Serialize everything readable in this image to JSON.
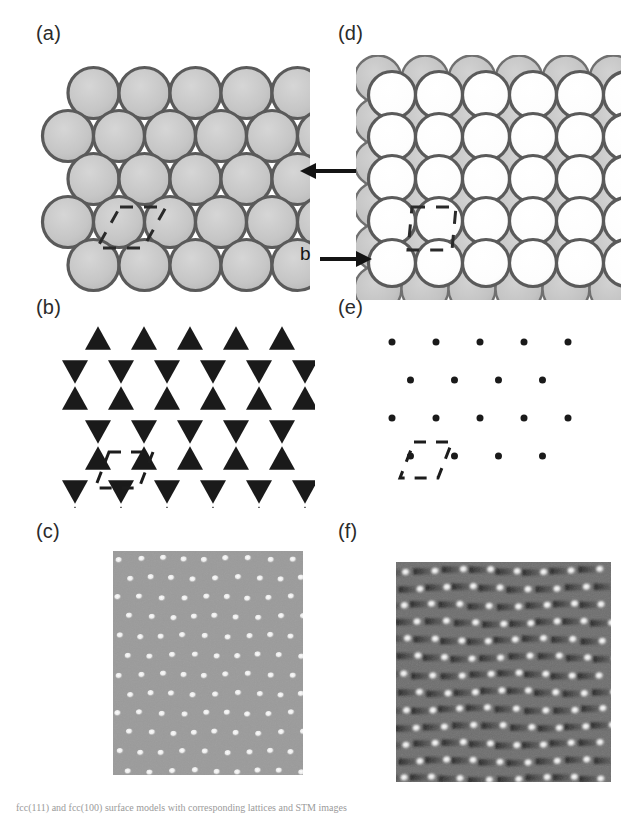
{
  "figure": {
    "background_color": "#ffffff",
    "width": 642,
    "height": 811,
    "caption_fragment": "fcc(111) and fcc(100) surface models with corresponding lattices and STM images"
  },
  "panels": [
    {
      "id": "a",
      "label": "(a)",
      "type": "hard-sphere-model",
      "description": "close-packed hexagonal sphere model, gray spheres",
      "label_x": 36,
      "label_y": 32,
      "box": {
        "x": 40,
        "y": 68,
        "width": 250,
        "height": 220
      },
      "sphere_fill": "#c6c6c6",
      "sphere_stroke": "#5a5a5a",
      "rows": [
        5,
        6,
        5,
        6,
        5
      ],
      "row_offsets": [
        0.5,
        0.0,
        0.5,
        0.0,
        0.5
      ],
      "sphere_radius_px": 25,
      "row_pitch_px": 43,
      "unit_cell": {
        "shape": "rhombus",
        "style": "dashed",
        "vertices": [
          [
            118,
            207
          ],
          [
            166,
            207
          ],
          [
            142,
            250
          ],
          [
            94,
            250
          ]
        ]
      }
    },
    {
      "id": "d",
      "label": "(d)",
      "type": "hard-sphere-model",
      "description": "square/quasi-square sphere model, white front layer over gray back layer",
      "label_x": 338,
      "label_y": 32,
      "box": {
        "x": 366,
        "y": 68,
        "width": 245,
        "height": 220
      },
      "sphere_fill": "#ffffff",
      "back_sphere_fill": "#c6c6c6",
      "sphere_stroke": "#5a5a5a",
      "rows": [
        6,
        6,
        6,
        6,
        6
      ],
      "sphere_radius_px": 23,
      "row_pitch_px": 42,
      "unit_cell": {
        "shape": "rhombus",
        "style": "dashed",
        "vertices": [
          [
            410,
            210
          ],
          [
            456,
            210
          ],
          [
            452,
            253
          ],
          [
            406,
            253
          ]
        ]
      }
    },
    {
      "id": "b",
      "label": "(b)",
      "type": "triangle-lattice",
      "description": "alternating up and down filled triangles on a honeycomb net",
      "label_x": 36,
      "label_y": 306,
      "box": {
        "x": 72,
        "y": 330,
        "width": 225,
        "height": 175
      },
      "marker_color": "#1a1a1a",
      "marker_size_px": 13,
      "unit_cell": {
        "shape": "rhombus",
        "style": "dashed",
        "vertices": [
          [
            108,
            452
          ],
          [
            152,
            452
          ],
          [
            138,
            488
          ],
          [
            94,
            488
          ]
        ]
      }
    },
    {
      "id": "e",
      "label": "(e)",
      "type": "dot-lattice",
      "description": "hexagonal array of small filled dots",
      "label_x": 338,
      "label_y": 306,
      "box": {
        "x": 388,
        "y": 340,
        "width": 215,
        "height": 155
      },
      "marker_color": "#1a1a1a",
      "marker_size_px": 7,
      "rows": [
        5,
        4,
        5,
        4
      ],
      "unit_cell": {
        "shape": "rhombus",
        "style": "dashed",
        "vertices": [
          [
            412,
            450
          ],
          [
            450,
            450
          ],
          [
            436,
            485
          ],
          [
            398,
            485
          ]
        ]
      }
    },
    {
      "id": "c",
      "label": "(c)",
      "type": "stm-image",
      "description": "STM topograph, light gray background with bright protrusions in hexagonal array",
      "label_x": 36,
      "label_y": 530,
      "box": {
        "x": 113,
        "y": 551,
        "width": 190,
        "height": 224
      },
      "background_color": "#9b9b9b",
      "spot_color": "#f2f2f2",
      "rows": 12,
      "cols": 9,
      "contrast": "low"
    },
    {
      "id": "f",
      "label": "(f)",
      "type": "stm-image",
      "description": "STM topograph, darker streaked background with bright protrusions in rectangular array",
      "label_x": 338,
      "label_y": 530,
      "box": {
        "x": 396,
        "y": 562,
        "width": 215,
        "height": 220
      },
      "background_color": "#6e6e6e",
      "spot_color": "#f6f6f6",
      "streak_color": "#262626",
      "rows": 13,
      "cols": 8,
      "contrast": "high"
    }
  ],
  "annotations": [
    {
      "id": "arrow-a",
      "label": "a",
      "direction": "left",
      "label_x": 366,
      "label_y": 162,
      "arrow_x": 300,
      "arrow_y": 172,
      "arrow_length": 55,
      "points_to": "panel-a-third-row"
    },
    {
      "id": "arrow-b",
      "label": "b",
      "direction": "right",
      "label_x": 303,
      "label_y": 247,
      "arrow_x": 320,
      "arrow_y": 257,
      "arrow_length": 48,
      "points_to": "panel-d-bottom-row"
    }
  ]
}
